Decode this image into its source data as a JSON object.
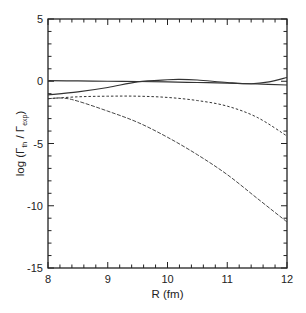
{
  "chart_data": {
    "type": "line",
    "title": "",
    "xlabel": "R  (fm)",
    "ylabel": "log (Γth / Γexp)",
    "ylabel_parts": {
      "prefix": "log (Γ",
      "sub1": "th",
      "mid": " / Γ",
      "sub2": "exp",
      "suffix": ")"
    },
    "xlim": [
      8,
      12
    ],
    "ylim": [
      -15,
      5
    ],
    "x_ticks": [
      8,
      9,
      10,
      11,
      12
    ],
    "x_tick_labels": [
      "8",
      "9",
      "10",
      "11",
      "12"
    ],
    "x_minor_step": 0.2,
    "y_ticks": [
      -15,
      -10,
      -5,
      0,
      5
    ],
    "y_tick_labels": [
      "-15",
      "-10",
      "-5",
      "0",
      "5"
    ],
    "y_minor_step": 1,
    "grid": false,
    "legend": null,
    "series": [
      {
        "name": "solid-flat",
        "style": "solid",
        "x": [
          8,
          8.5,
          9,
          9.5,
          10,
          10.5,
          11,
          11.5,
          12
        ],
        "values": [
          0.05,
          0.03,
          0.0,
          -0.02,
          -0.05,
          -0.1,
          -0.15,
          -0.22,
          -0.3
        ]
      },
      {
        "name": "solid-wavy",
        "style": "solid",
        "x": [
          8,
          8.5,
          9,
          9.5,
          10,
          10.2,
          10.5,
          11,
          11.4,
          11.7,
          12
        ],
        "values": [
          -1.1,
          -0.85,
          -0.5,
          -0.05,
          0.12,
          0.15,
          0.1,
          -0.1,
          -0.2,
          -0.05,
          0.3
        ]
      },
      {
        "name": "short-dash",
        "style": "dotted",
        "x": [
          8,
          8.5,
          9,
          9.5,
          10,
          10.5,
          11,
          11.5,
          12
        ],
        "values": [
          -1.4,
          -1.25,
          -1.2,
          -1.2,
          -1.3,
          -1.55,
          -2.0,
          -2.9,
          -4.4
        ]
      },
      {
        "name": "long-dash",
        "style": "dashed",
        "x": [
          8,
          8.25,
          8.5,
          9,
          9.5,
          10,
          10.5,
          11,
          11.5,
          12
        ],
        "values": [
          -1.4,
          -1.35,
          -1.6,
          -2.4,
          -3.3,
          -4.5,
          -5.9,
          -7.5,
          -9.4,
          -11.3
        ]
      }
    ]
  }
}
